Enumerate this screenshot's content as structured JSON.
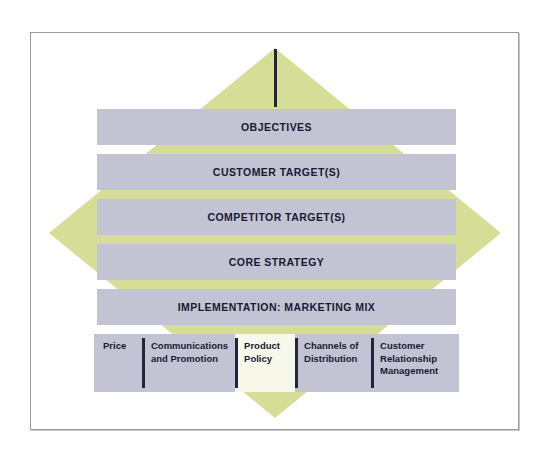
{
  "diagram": {
    "colors": {
      "diamond_fill": "#d6dd96",
      "bar_fill": "#c2c3d3",
      "highlight_fill": "#f7f8ea",
      "spine": "#24243f",
      "text": "#191933",
      "frame_border": "#9a9a9e"
    },
    "bars": [
      {
        "label": "OBJECTIVES"
      },
      {
        "label": "CUSTOMER TARGET(S)"
      },
      {
        "label": "COMPETITOR TARGET(S)"
      },
      {
        "label": "CORE STRATEGY"
      },
      {
        "label": "IMPLEMENTATION: MARKETING MIX"
      }
    ],
    "marketing_mix": [
      {
        "label": "Price",
        "highlighted": false
      },
      {
        "label": "Communications and Promotion",
        "highlighted": false
      },
      {
        "label": "Product Policy",
        "highlighted": true
      },
      {
        "label": "Channels of Distribution",
        "highlighted": false
      },
      {
        "label": "Customer Relationship Management",
        "highlighted": false
      }
    ]
  }
}
